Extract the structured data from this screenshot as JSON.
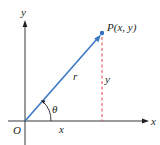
{
  "diagram": {
    "labels": {
      "y_axis": "y",
      "x_axis": "x",
      "origin": "O",
      "point": "P(x, y)",
      "radius": "r",
      "angle": "θ",
      "horizontal_component": "x",
      "vertical_component": "y"
    },
    "colors": {
      "axis": "#231f20",
      "vector": "#3a78c2",
      "point": "#2f6fc0",
      "dashed_line": "#e0424a"
    },
    "geometry": {
      "origin": [
        25,
        121
      ],
      "point": [
        102,
        33
      ]
    }
  }
}
